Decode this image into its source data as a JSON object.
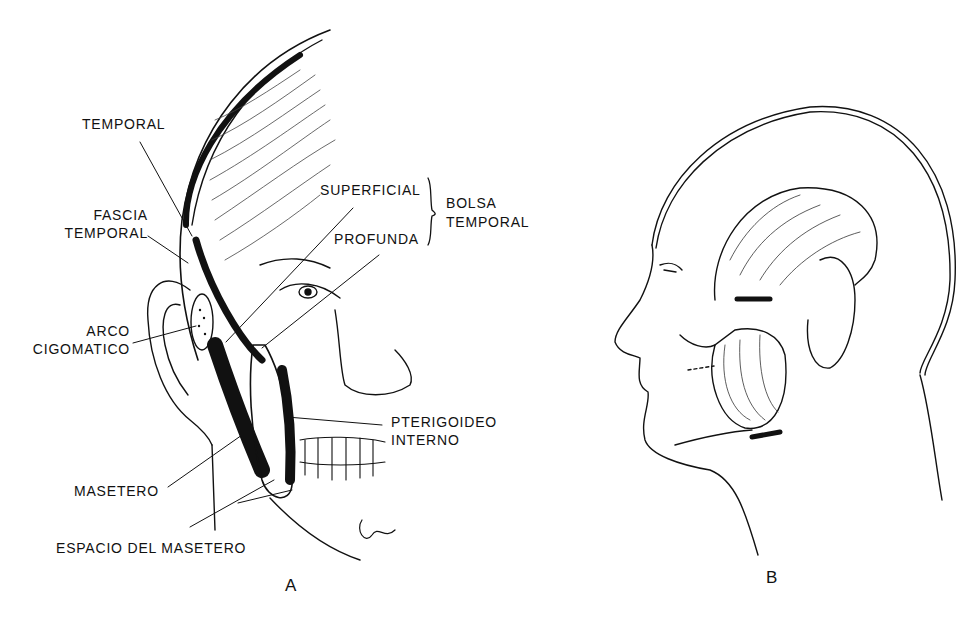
{
  "figure": {
    "panel_a": {
      "letter": "A",
      "labels": {
        "temporal": "TEMPORAL",
        "fascia_line1": "FASCIA",
        "fascia_line2": "TEMPORAL",
        "arco_line1": "ARCO",
        "arco_line2": "CIGOMATICO",
        "superficial": "SUPERFICIAL",
        "profunda": "PROFUNDA",
        "bolsa_line1": "BOLSA",
        "bolsa_line2": "TEMPORAL",
        "pterigoideo_line1": "PTERIGOIDEO",
        "pterigoideo_line2": "INTERNO",
        "masetero": "MASETERO",
        "espacio": "ESPACIO DEL MASETERO"
      }
    },
    "panel_b": {
      "letter": "B"
    },
    "colors": {
      "ink": "#111111",
      "paper": "#ffffff"
    }
  }
}
